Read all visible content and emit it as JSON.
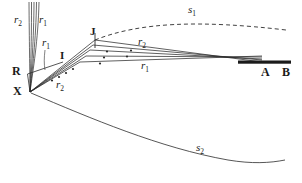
{
  "figure": {
    "background_color": "#ffffff",
    "ink_color": "#2b2b2b",
    "width": 302,
    "height": 183
  },
  "labels": {
    "r2_top": {
      "base": "r",
      "sub": "2",
      "x": 14,
      "y": 20,
      "size": 11
    },
    "r1_top": {
      "base": "r",
      "sub": "1",
      "x": 39,
      "y": 20,
      "size": 11
    },
    "r1_mid": {
      "base": "r",
      "sub": "1",
      "x": 42,
      "y": 43,
      "size": 11
    },
    "r2_low": {
      "base": "r",
      "sub": "2",
      "x": 56,
      "y": 85,
      "size": 11
    },
    "r2_right": {
      "base": "r",
      "sub": "2",
      "x": 138,
      "y": 42,
      "size": 11
    },
    "r1_right": {
      "base": "r",
      "sub": "1",
      "x": 141,
      "y": 66,
      "size": 11
    },
    "s1": {
      "base": "s",
      "sub": "1",
      "x": 188,
      "y": 9,
      "size": 11
    },
    "s2": {
      "base": "s",
      "sub": "2",
      "x": 196,
      "y": 147,
      "size": 11
    },
    "point_R": {
      "text": "R",
      "x": 12,
      "y": 65,
      "size": 12
    },
    "point_X": {
      "text": "X",
      "x": 13,
      "y": 85,
      "size": 12
    },
    "point_I": {
      "text": "I",
      "x": 60,
      "y": 56,
      "size": 11
    },
    "point_J": {
      "text": "J",
      "x": 90,
      "y": 31,
      "size": 11
    },
    "point_A": {
      "text": "A",
      "x": 261,
      "y": 66,
      "size": 12
    },
    "point_B": {
      "text": "B",
      "x": 282,
      "y": 66,
      "size": 12
    }
  },
  "geometry": {
    "vertex_X": {
      "x": 30,
      "y": 92
    },
    "point_R": {
      "x": 28,
      "y": 74
    },
    "point_J": {
      "x": 95,
      "y": 40
    },
    "screen_bar": {
      "x1": 238,
      "y1": 63,
      "x2": 291,
      "y2": 63
    },
    "vertical_bundle_top_y": 2,
    "vertical_bundle_xs": [
      29,
      31.5,
      34,
      36.5,
      39
    ],
    "fan_end_points": [
      {
        "x": 262,
        "y": 62
      },
      {
        "x": 262,
        "y": 60
      },
      {
        "x": 262,
        "y": 58
      },
      {
        "x": 262,
        "y": 56
      }
    ],
    "tick_dots": [
      {
        "x": 107,
        "y": 51
      },
      {
        "x": 128,
        "y": 50
      },
      {
        "x": 103,
        "y": 57
      },
      {
        "x": 124,
        "y": 56
      },
      {
        "x": 100,
        "y": 63
      },
      {
        "x": 73,
        "y": 69
      },
      {
        "x": 66,
        "y": 73
      },
      {
        "x": 59,
        "y": 77
      },
      {
        "x": 52,
        "y": 80
      }
    ],
    "curve_s1": "M 95 40 C 140 22, 200 20, 286 30",
    "curve_s2": "M 31 93 C 90 118, 160 148, 228 160 C 252 164, 270 163, 285 160"
  }
}
